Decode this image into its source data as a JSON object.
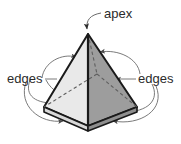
{
  "figure": {
    "background_color": "#ffffff",
    "labels": {
      "apex": "apex",
      "edges_left": "edges",
      "edges_right": "edges"
    },
    "colors": {
      "outline": "#1a1a1a",
      "face_left": "#e9e9e9",
      "face_right": "#9d9d9d",
      "face_base_left": "#d8d8d8",
      "face_base_right": "#8f8f8f",
      "hidden_edge": "#6e6e6e",
      "leader": "#6b6b6b",
      "text": "#2b2b2b"
    },
    "geometry": {
      "apex": [
        88,
        34
      ],
      "base_front": [
        88,
        126
      ],
      "base_left": [
        44,
        107
      ],
      "base_right": [
        137,
        107
      ],
      "base_back": [
        97,
        74
      ]
    },
    "annotations": [
      {
        "name": "apex-callout",
        "label": "apex",
        "text_position": [
          103,
          14
        ],
        "points_to": [
          88,
          34
        ]
      },
      {
        "name": "edges-left-callout",
        "label": "edges",
        "text_position": [
          8,
          79
        ],
        "arrow_count": 4
      },
      {
        "name": "edges-right-callout",
        "label": "edges",
        "text_position": [
          138,
          79
        ],
        "arrow_count": 4
      }
    ]
  }
}
